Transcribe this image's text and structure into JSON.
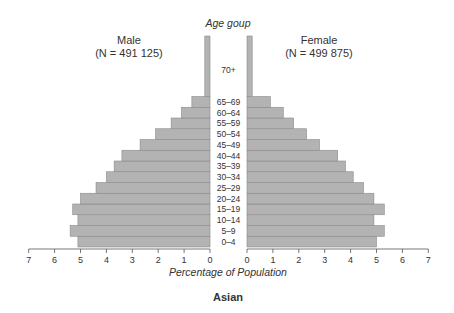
{
  "chart_data": {
    "type": "bar",
    "subtype": "population-pyramid",
    "title": "Asian",
    "center_label": "Age goup",
    "xlabel": "Percentage of Population",
    "ylabel": "Age goup",
    "xlim": [
      0,
      7
    ],
    "x_ticks": [
      0,
      1,
      2,
      3,
      4,
      5,
      6,
      7
    ],
    "grid": false,
    "legend": null,
    "categories": [
      "0–4",
      "5–9",
      "10–14",
      "15–19",
      "20–24",
      "25–29",
      "30–34",
      "35–39",
      "40–44",
      "45–49",
      "50–54",
      "55–59",
      "60–64",
      "65–69",
      "70+"
    ],
    "series": [
      {
        "name": "Male",
        "label": "Male",
        "n_label": "(N = 491 125)",
        "side": "left",
        "values": [
          5.1,
          5.4,
          5.1,
          5.3,
          5.0,
          4.4,
          4.0,
          3.7,
          3.4,
          2.7,
          2.1,
          1.5,
          1.1,
          0.7,
          0.2
        ]
      },
      {
        "name": "Female",
        "label": "Female",
        "n_label": "(N = 499 875)",
        "side": "right",
        "values": [
          5.0,
          5.3,
          4.9,
          5.3,
          4.9,
          4.5,
          4.1,
          3.8,
          3.5,
          2.8,
          2.3,
          1.8,
          1.4,
          0.9,
          0.2
        ]
      }
    ],
    "colors": {
      "bar_fill": "#b3b3b3",
      "bar_stroke": "#8a8a8a",
      "axis": "#555555"
    }
  }
}
